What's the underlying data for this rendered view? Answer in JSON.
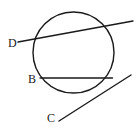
{
  "figure": {
    "name": "circle-with-secant-chord-and-tangent",
    "background_color": "#ffffff",
    "stroke_color": "#1a1a1a",
    "width": 139,
    "height": 132
  },
  "labels": {
    "d": "D",
    "b": "B",
    "c": "C"
  },
  "chart_data": {
    "type": "diagram",
    "title": "",
    "xlabel": "",
    "ylabel": "",
    "shapes": [
      {
        "name": "circle",
        "type": "circle",
        "cx": 73.5,
        "cy": 52.5,
        "r": 40.5,
        "stroke": "#1a1a1a",
        "stroke_width": 1.4,
        "fill": "none"
      },
      {
        "name": "secant-line-through-d",
        "type": "line",
        "x1": 18,
        "y1": 42,
        "x2": 133,
        "y2": 21,
        "stroke": "#1a1a1a",
        "stroke_width": 1.4
      },
      {
        "name": "chord-at-b",
        "type": "line",
        "x1": 40,
        "y1": 78,
        "x2": 112.5,
        "y2": 78,
        "stroke": "#1a1a1a",
        "stroke_width": 1.4
      },
      {
        "name": "tangent-line-through-c",
        "type": "line",
        "x1": 59,
        "y1": 121,
        "x2": 131,
        "y2": 75,
        "stroke": "#1a1a1a",
        "stroke_width": 1.4
      }
    ],
    "points": [
      {
        "name": "D",
        "label": "D",
        "label_x": 8,
        "label_y": 37
      },
      {
        "name": "B",
        "label": "B",
        "label_x": 28,
        "label_y": 73
      },
      {
        "name": "C",
        "label": "C",
        "label_x": 47,
        "label_y": 112
      }
    ]
  }
}
